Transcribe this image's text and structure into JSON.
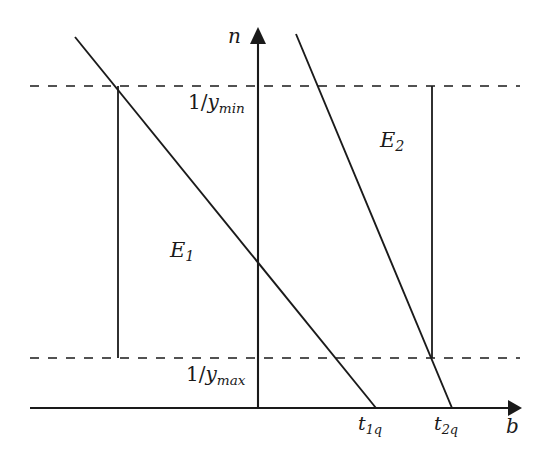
{
  "figure": {
    "type": "line-diagram",
    "background_color": "#ffffff",
    "stroke_color": "#1a1a1a",
    "axes": {
      "vertical": {
        "name": "n-axis",
        "label": "n",
        "label_position": {
          "x": 228,
          "y": 26
        },
        "x": 258,
        "y_top": 28,
        "y_bottom": 408,
        "arrowhead": "up"
      },
      "horizontal": {
        "name": "b-axis",
        "label": "b",
        "label_position": {
          "x": 506,
          "y": 416
        },
        "y": 408,
        "x_left": 30,
        "x_right": 518,
        "arrowhead": "right"
      }
    },
    "reference_lines": [
      {
        "name": "y-min-line",
        "label_html": "1/y<sub>min</sub>",
        "label_text": "1/ymin",
        "style": "dashed",
        "y": 86,
        "x_start": 30,
        "x_end": 520
      },
      {
        "name": "y-max-line",
        "label_html": "1/y<sub>max</sub>",
        "label_text": "1/ymax",
        "style": "dashed",
        "y": 358,
        "x_start": 30,
        "x_end": 520
      }
    ],
    "curves": [
      {
        "name": "E1-line",
        "label_text": "E1",
        "label_base": "E",
        "label_sub": "1",
        "style": "solid",
        "from": {
          "x": 75,
          "y": 37
        },
        "to": {
          "x": 376,
          "y": 408
        },
        "label_position": {
          "x": 170,
          "y": 240
        }
      },
      {
        "name": "E2-line",
        "label_text": "E2",
        "label_base": "E",
        "label_sub": "2",
        "style": "solid",
        "from": {
          "x": 296,
          "y": 34
        },
        "to": {
          "x": 452,
          "y": 408
        },
        "label_position": {
          "x": 380,
          "y": 130
        }
      }
    ],
    "drop_lines": [
      {
        "name": "left-drop-line",
        "x": 118,
        "y_top": 86,
        "y_bottom": 358
      },
      {
        "name": "right-drop-line",
        "x": 432,
        "y_top": 86,
        "y_bottom": 358
      }
    ],
    "tick_labels": [
      {
        "name": "tick-t1q",
        "label_base": "t",
        "label_sub": "1q",
        "label_text": "t1q",
        "x": 376,
        "axis": "b"
      },
      {
        "name": "tick-t2q",
        "label_base": "t",
        "label_sub": "2q",
        "label_text": "t2q",
        "x": 452,
        "axis": "b"
      }
    ]
  }
}
